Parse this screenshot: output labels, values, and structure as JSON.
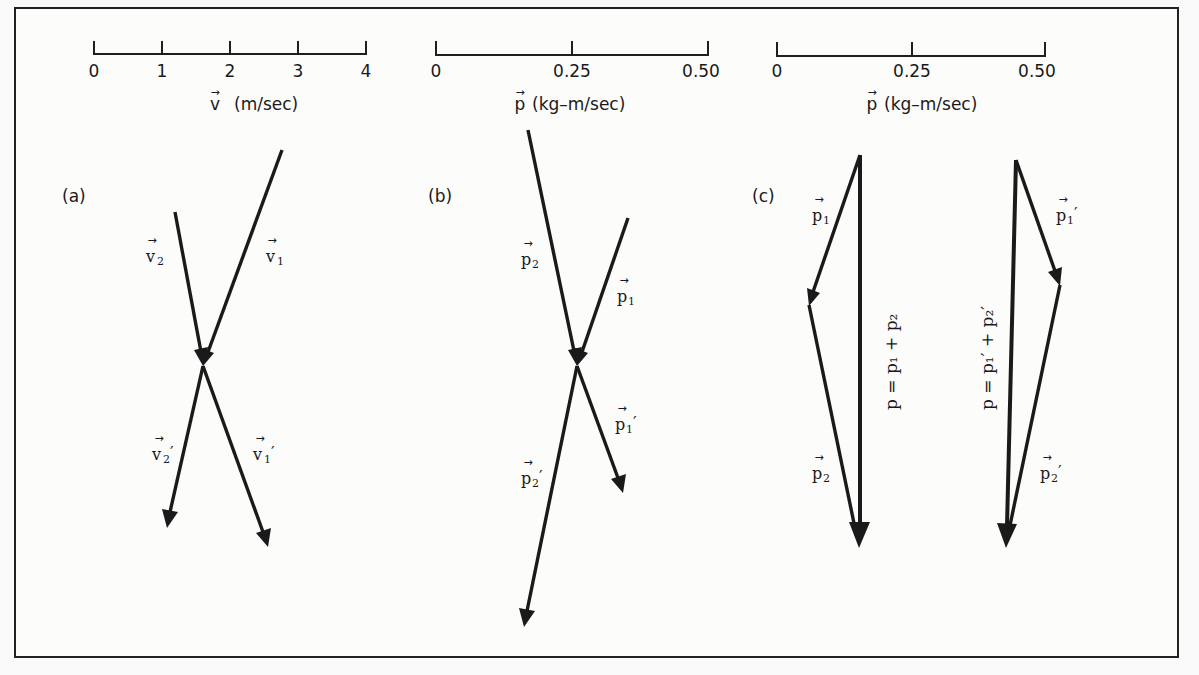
{
  "figure": {
    "scales": [
      {
        "id": "velocity-scale",
        "ticks": [
          "0",
          "1",
          "2",
          "3",
          "4"
        ],
        "title_symbol": "v",
        "title_unit": "(m/sec)"
      },
      {
        "id": "momentum-scale-b",
        "ticks": [
          "0",
          "0.25",
          "0.50"
        ],
        "title_symbol": "p",
        "title_unit": "(kg–m/sec)"
      },
      {
        "id": "momentum-scale-c",
        "ticks": [
          "0",
          "0.25",
          "0.50"
        ],
        "title_symbol": "p",
        "title_unit": "(kg–m/sec)"
      }
    ],
    "panels": {
      "a": {
        "label": "(a)",
        "vectors": [
          {
            "name": "v",
            "sub": "2",
            "prime": ""
          },
          {
            "name": "v",
            "sub": "1",
            "prime": ""
          },
          {
            "name": "v",
            "sub": "2",
            "prime": "′"
          },
          {
            "name": "v",
            "sub": "1",
            "prime": "′"
          }
        ]
      },
      "b": {
        "label": "(b)",
        "vectors": [
          {
            "name": "p",
            "sub": "2",
            "prime": ""
          },
          {
            "name": "p",
            "sub": "1",
            "prime": ""
          },
          {
            "name": "p",
            "sub": "1",
            "prime": "′"
          },
          {
            "name": "p",
            "sub": "2",
            "prime": "′"
          }
        ]
      },
      "c": {
        "label": "(c)",
        "left": {
          "vectors": [
            {
              "name": "p",
              "sub": "1",
              "prime": ""
            },
            {
              "name": "p",
              "sub": "2",
              "prime": ""
            }
          ],
          "equation": "p = p₁ + p₂"
        },
        "right": {
          "vectors": [
            {
              "name": "p",
              "sub": "1",
              "prime": "′"
            },
            {
              "name": "p",
              "sub": "2",
              "prime": "′"
            }
          ],
          "equation": "p = p₁′ + p₂′"
        }
      }
    }
  }
}
